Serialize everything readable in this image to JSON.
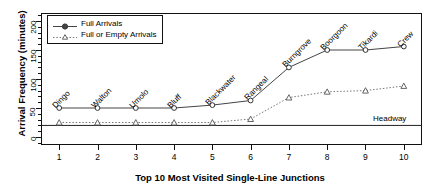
{
  "chart_data": {
    "type": "line",
    "title": "",
    "xlabel": "Top 10 Most Visited Single-Line Junctions",
    "ylabel": "Arrival Frequency (minutes)",
    "x": [
      1,
      2,
      3,
      4,
      5,
      6,
      7,
      8,
      9,
      10
    ],
    "xtick_labels": [
      "1",
      "2",
      "3",
      "4",
      "5",
      "6",
      "7",
      "8",
      "9",
      "10"
    ],
    "ytick_labels": [
      "0",
      "50",
      "100",
      "150",
      "200"
    ],
    "ytick_values": [
      0,
      50,
      100,
      150,
      200
    ],
    "ylim": [
      -12,
      212
    ],
    "xlim": [
      0.55,
      10.45
    ],
    "grid": false,
    "legend_position": "top-left",
    "point_labels": [
      "Dingo",
      "Walton",
      "Umolo",
      "Bluff",
      "Blackwater",
      "Rangeal",
      "Burngrove",
      "Boorgoon",
      "Tikardi",
      "Crew"
    ],
    "series": [
      {
        "name": "Full Arrivals",
        "marker": "filled-circle",
        "linestyle": "solid",
        "color": "#444444",
        "values": [
          50,
          50,
          50,
          50,
          55,
          63,
          120,
          150,
          150,
          156
        ]
      },
      {
        "name": "Full or Empty Arrivals",
        "marker": "open-triangle",
        "linestyle": "dotted",
        "color": "#777777",
        "values": [
          25,
          25,
          25,
          25,
          25,
          31,
          68,
          78,
          80,
          88
        ]
      }
    ],
    "annotations": [
      {
        "name": "headway-line",
        "label": "Headway",
        "type": "hline",
        "value": 20,
        "color": "#222222"
      }
    ]
  }
}
